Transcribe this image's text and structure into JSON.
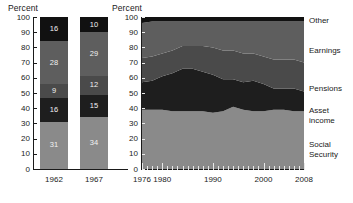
{
  "left_panel": {
    "title": "Percent",
    "y_ticks": [
      0,
      10,
      20,
      30,
      40,
      50,
      60,
      70,
      80,
      90,
      100
    ],
    "x_labels": [
      "1962",
      "1967"
    ]
  },
  "right_panel": {
    "title": "Percent",
    "y_ticks": [
      0,
      10,
      20,
      30,
      40,
      50,
      60,
      70,
      80,
      90,
      100
    ],
    "x_labels": [
      "1976",
      "1980",
      "1990",
      "2000",
      "2008"
    ]
  },
  "legend": {
    "items": [
      {
        "label": "Other",
        "color": "#111111"
      },
      {
        "label": "Earnings",
        "color": "#5e5e5e"
      },
      {
        "label": "Pensions",
        "color": "#4a4a4a"
      },
      {
        "label": "Asset\nincome",
        "color": "#1e1e1e"
      },
      {
        "label": "Social\nSecurity",
        "color": "#8a8a8a"
      }
    ],
    "l0": "Other",
    "l1": "Earnings",
    "l2": "Pensions",
    "l3a": "Asset",
    "l3b": "income",
    "l4a": "Social",
    "l4b": "Security"
  },
  "chart_data": [
    {
      "type": "bar",
      "stacked": true,
      "title": "Percent",
      "xlabel": "",
      "ylabel": "Percent",
      "ylim": [
        0,
        100
      ],
      "grid": false,
      "categories": [
        "1962",
        "1967"
      ],
      "series": [
        {
          "name": "Social Security",
          "color": "#8a8a8a",
          "values": [
            31,
            34
          ]
        },
        {
          "name": "Asset income",
          "color": "#1e1e1e",
          "values": [
            16,
            15
          ]
        },
        {
          "name": "Pensions",
          "color": "#4a4a4a",
          "values": [
            9,
            12
          ]
        },
        {
          "name": "Earnings",
          "color": "#5e5e5e",
          "values": [
            28,
            29
          ]
        },
        {
          "name": "Other",
          "color": "#111111",
          "values": [
            16,
            10
          ]
        }
      ],
      "data_labels": {
        "1962": [
          31,
          16,
          9,
          28,
          16
        ],
        "1967": [
          34,
          15,
          12,
          29,
          10
        ]
      }
    },
    {
      "type": "area",
      "stacked": true,
      "title": "Percent",
      "xlabel": "",
      "ylabel": "Percent",
      "ylim": [
        0,
        100
      ],
      "xlim": [
        1976,
        2008
      ],
      "grid": false,
      "legend_position": "right",
      "x": [
        1976,
        1978,
        1980,
        1982,
        1984,
        1986,
        1988,
        1990,
        1992,
        1994,
        1996,
        1998,
        2000,
        2002,
        2004,
        2006,
        2008
      ],
      "series": [
        {
          "name": "Social Security",
          "color": "#8a8a8a",
          "values": [
            39,
            39,
            39,
            38,
            38,
            38,
            38,
            37,
            38,
            41,
            39,
            38,
            38,
            39,
            39,
            38,
            38
          ]
        },
        {
          "name": "Asset income",
          "color": "#1e1e1e",
          "values": [
            18,
            19,
            22,
            25,
            28,
            28,
            26,
            25,
            21,
            18,
            18,
            20,
            18,
            14,
            14,
            15,
            13
          ]
        },
        {
          "name": "Pensions",
          "color": "#4a4a4a",
          "values": [
            16,
            16,
            15,
            15,
            15,
            15,
            17,
            18,
            19,
            19,
            19,
            18,
            18,
            19,
            19,
            19,
            19
          ]
        },
        {
          "name": "Earnings",
          "color": "#5e5e5e",
          "values": [
            23,
            23,
            21,
            19,
            16,
            16,
            16,
            17,
            19,
            19,
            21,
            21,
            23,
            25,
            25,
            25,
            27
          ]
        },
        {
          "name": "Other",
          "color": "#111111",
          "values": [
            4,
            3,
            3,
            3,
            3,
            3,
            3,
            3,
            3,
            3,
            3,
            3,
            3,
            3,
            3,
            3,
            3
          ]
        }
      ]
    }
  ]
}
